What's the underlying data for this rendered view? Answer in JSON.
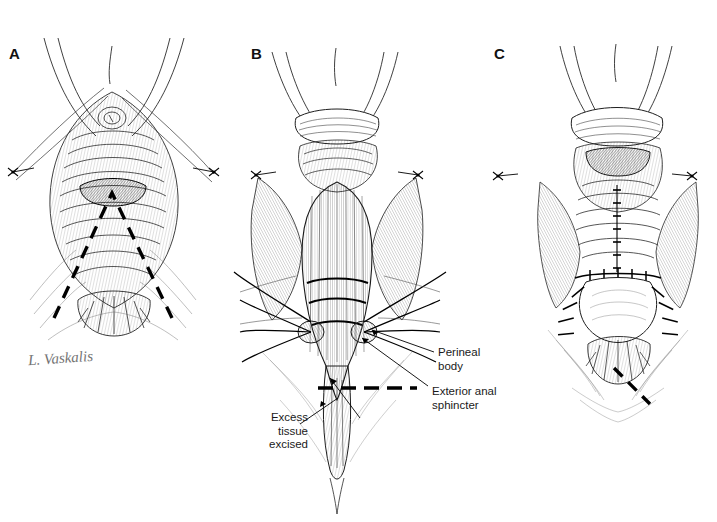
{
  "figure": {
    "kind": "medical-line-illustration",
    "technique": "pen-and-ink stipple and hatch",
    "background_color": "#ffffff",
    "ink_color": "#000000",
    "panel_count": 3
  },
  "panels": [
    {
      "id": "A",
      "letter": "A",
      "caption": "",
      "stage": "Incision marked",
      "markings": "dashed V-shaped incision line over the posterior vaginal wall and perineum",
      "signature": "L. Vaskalis"
    },
    {
      "id": "B",
      "letter": "B",
      "caption": "",
      "stage": "Dissection with structures identified",
      "markings": "transverse approximating sutures, lateral traction sutures, dashed transverse excision line"
    },
    {
      "id": "C",
      "letter": "C",
      "caption": "",
      "stage": "Completed closure",
      "markings": "interrupted midline and transverse sutures, dashed line at lower right"
    }
  ],
  "annotations": {
    "perineal_body": {
      "label": "Perineal\nbody",
      "panel": "B",
      "position": "right"
    },
    "exterior_anal_sphincter": {
      "label": "Exterior anal\nsphincter",
      "panel": "B",
      "position": "right"
    },
    "excess_tissue_excised": {
      "label": "Excess\ntissue\nexcised",
      "panel": "B",
      "position": "left"
    }
  },
  "signature": {
    "artist": "L. Vaskalis"
  }
}
